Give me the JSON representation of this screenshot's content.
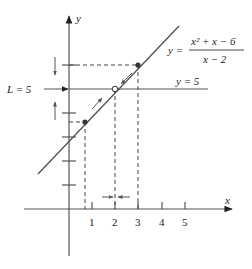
{
  "diagram": {
    "axes": {
      "x_label": "x",
      "y_label": "y",
      "x_ticks": [
        "1",
        "2",
        "3",
        "4",
        "5"
      ]
    },
    "function": {
      "lhs": "y =",
      "numerator": "x² + x − 6",
      "denominator": "x − 2"
    },
    "limit_line": {
      "label": "y = 5"
    },
    "limit_label": "L = 5",
    "points": [
      {
        "name": "left-point",
        "x": 1,
        "y": 4,
        "style": "filled"
      },
      {
        "name": "hole",
        "x": 2,
        "y": 5,
        "style": "open"
      },
      {
        "name": "right-point",
        "x": 3,
        "y": 6,
        "style": "filled"
      }
    ],
    "colors": {
      "line": "#555555",
      "text": "#222222",
      "background": "#ffffff"
    }
  }
}
